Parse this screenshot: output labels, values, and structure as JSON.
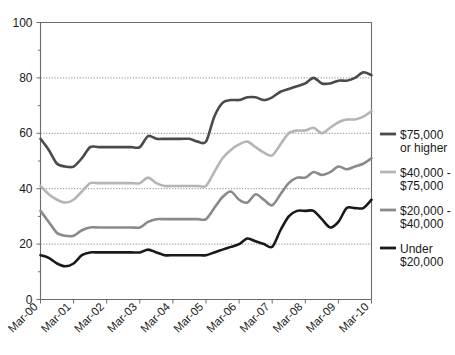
{
  "chart_data": {
    "type": "line",
    "title": "",
    "subtitle": "",
    "xlabel": "",
    "ylabel": "",
    "ylim": [
      0,
      100
    ],
    "yticks": [
      0,
      20,
      40,
      60,
      80,
      100
    ],
    "ytick_labels": [
      "0",
      "20",
      "40",
      "60",
      "80",
      "100"
    ],
    "y_minor_ticks": [
      10,
      30,
      50,
      70,
      90
    ],
    "grid": "horizontal-dotted-at-20-40-60-80",
    "legend_position": "right",
    "categories": [
      "Mar-00",
      "Jun-00",
      "Sep-00",
      "Dec-00",
      "Mar-01",
      "Jun-01",
      "Sep-01",
      "Dec-01",
      "Mar-02",
      "Jun-02",
      "Sep-02",
      "Dec-02",
      "Mar-03",
      "Jun-03",
      "Sep-03",
      "Dec-03",
      "Mar-04",
      "Jun-04",
      "Sep-04",
      "Dec-04",
      "Mar-05",
      "Jun-05",
      "Sep-05",
      "Dec-05",
      "Mar-06",
      "Jun-06",
      "Sep-06",
      "Dec-06",
      "Mar-07",
      "Jun-07",
      "Sep-07",
      "Dec-07",
      "Mar-08",
      "Jun-08",
      "Sep-08",
      "Dec-08",
      "Mar-09",
      "Jun-09",
      "Sep-09",
      "Dec-09",
      "Mar-10"
    ],
    "xtick_labels": [
      "Mar-00",
      "Mar-01",
      "Mar-02",
      "Mar-03",
      "Mar-04",
      "Mar-05",
      "Mar-06",
      "Mar-07",
      "Mar-08",
      "Mar-09",
      "Mar-10"
    ],
    "series": [
      {
        "name": "$75,000 or higher",
        "legend_label_line1": "$75,000",
        "legend_label_line2": "or higher",
        "color": "#4a4a4a",
        "values": [
          58,
          54,
          49,
          48,
          48,
          51,
          55,
          55,
          55,
          55,
          55,
          55,
          55,
          59,
          58,
          58,
          58,
          58,
          58,
          57,
          57,
          66,
          71,
          72,
          72,
          73,
          73,
          72,
          73,
          75,
          76,
          77,
          78,
          80,
          78,
          78,
          79,
          79,
          80,
          82,
          81
        ]
      },
      {
        "name": "$40,000 - $75,000",
        "legend_label_line1": "$40,000 -",
        "legend_label_line2": "$75,000",
        "color": "#b5b5b5",
        "values": [
          41,
          38,
          36,
          35,
          36,
          39,
          42,
          42,
          42,
          42,
          42,
          42,
          42,
          44,
          42,
          41,
          41,
          41,
          41,
          41,
          41,
          46,
          51,
          54,
          56,
          57,
          55,
          53,
          52,
          56,
          60,
          61,
          61,
          62,
          60,
          62,
          64,
          65,
          65,
          66,
          68
        ]
      },
      {
        "name": "$20,000 - $40,000",
        "legend_label_line1": "$20,000 -",
        "legend_label_line2": "$40,000",
        "color": "#8a8a8a",
        "values": [
          32,
          28,
          24,
          23,
          23,
          25,
          26,
          26,
          26,
          26,
          26,
          26,
          26,
          28,
          29,
          29,
          29,
          29,
          29,
          29,
          29,
          33,
          37,
          39,
          36,
          35,
          38,
          36,
          34,
          38,
          42,
          44,
          44,
          46,
          45,
          46,
          48,
          47,
          48,
          49,
          51
        ]
      },
      {
        "name": "Under $20,000",
        "legend_label_line1": "Under",
        "legend_label_line2": "$20,000",
        "color": "#1a1a1a",
        "values": [
          16,
          15,
          13,
          12,
          13,
          16,
          17,
          17,
          17,
          17,
          17,
          17,
          17,
          18,
          17,
          16,
          16,
          16,
          16,
          16,
          16,
          17,
          18,
          19,
          20,
          22,
          21,
          20,
          19,
          25,
          30,
          32,
          32,
          32,
          29,
          26,
          28,
          33,
          33,
          33,
          36
        ]
      }
    ]
  },
  "legend": {
    "entries": [
      {
        "line1": "$75,000",
        "line2": "or higher",
        "color": "#4a4a4a"
      },
      {
        "line1": "$40,000 -",
        "line2": "$75,000",
        "color": "#b5b5b5"
      },
      {
        "line1": "$20,000 -",
        "line2": "$40,000",
        "color": "#8a8a8a"
      },
      {
        "line1": "Under",
        "line2": "$20,000",
        "color": "#1a1a1a"
      }
    ]
  }
}
